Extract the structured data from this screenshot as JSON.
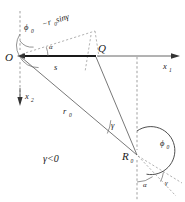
{
  "figure": {
    "type": "geometry-diagram",
    "background_color": "#ffffff",
    "line_color": "#555555",
    "emphasis_color": "#1a1a1a"
  },
  "points": {
    "origin": {
      "label": "O",
      "x": 20,
      "y": 56
    },
    "q_point": {
      "label": "Q",
      "x": 96,
      "y": 56
    },
    "r_point": {
      "label": "R",
      "subscript": "0",
      "x": 137,
      "y": 155
    }
  },
  "axes": {
    "x1": {
      "label": "x",
      "subscript": "1",
      "direction": "right"
    },
    "x2": {
      "label": "x",
      "subscript": "2",
      "direction": "down"
    }
  },
  "segments": {
    "s": {
      "label": "s",
      "from": "O",
      "to": "Q",
      "style": "thick-solid"
    },
    "r0": {
      "label": "r",
      "subscript": "0",
      "from": "O",
      "to": "R0",
      "style": "solid"
    },
    "qr": {
      "from": "Q",
      "to": "R0",
      "style": "solid"
    }
  },
  "construction": {
    "projection_label": "−r",
    "projection_subscript": "0",
    "projection_tail": " sinγ",
    "projection_full": "−r₀ sinγ"
  },
  "angles": {
    "phi0_at_origin": {
      "label": "ϕ",
      "subscript": "0"
    },
    "phi0_at_r": {
      "label": "ϕ",
      "subscript": "0"
    },
    "alpha_at_origin": {
      "label": "α"
    },
    "alpha_at_r": {
      "label": "α"
    },
    "gamma_at_r": {
      "label": "γ"
    },
    "gamma_lower": {
      "label": "γ"
    }
  },
  "condition": {
    "text": "γ<0"
  }
}
